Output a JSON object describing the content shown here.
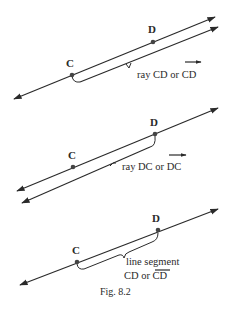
{
  "figure": {
    "caption": "Fig. 8.2",
    "colors": {
      "ink": "#2a2a2a",
      "background": "#ffffff"
    },
    "panels": [
      {
        "id": "ray-cd",
        "point_labels": {
          "c": "C",
          "d": "D"
        },
        "description_parts": {
          "prefix": "ray CD or ",
          "notation": "CD"
        },
        "notation_mark": "ray-arrow"
      },
      {
        "id": "ray-dc",
        "point_labels": {
          "c": "C",
          "d": "D"
        },
        "description_parts": {
          "prefix": "ray DC or ",
          "notation": "DC"
        },
        "notation_mark": "ray-arrow"
      },
      {
        "id": "segment-cd",
        "point_labels": {
          "c": "C",
          "d": "D"
        },
        "description_line1": "line segment",
        "description_parts": {
          "prefix": "CD or ",
          "notation": "CD"
        },
        "notation_mark": "overbar"
      }
    ]
  }
}
